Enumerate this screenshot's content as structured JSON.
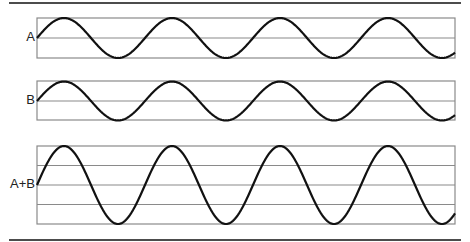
{
  "figure": {
    "panels": [
      {
        "id": "A",
        "label": "A",
        "top": 18,
        "bottom": 58,
        "hlines": [
          38
        ],
        "amplitude": 20,
        "center": 38
      },
      {
        "id": "B",
        "label": "B",
        "top": 81,
        "bottom": 120,
        "hlines": [
          101
        ],
        "amplitude": 19.5,
        "center": 101
      },
      {
        "id": "AB",
        "label": "A+B",
        "top": 146,
        "bottom": 224,
        "hlines": [
          165.5,
          185,
          204.5
        ],
        "amplitude": 39,
        "center": 185
      }
    ],
    "box_left": 37,
    "box_right": 455,
    "wave_period": 108,
    "rules": {
      "top_y": 3,
      "bottom_y": 240,
      "left": 9,
      "right": 461
    },
    "colors": {
      "wave": "#111111",
      "box": "#8a8a8a",
      "rule": "#111111"
    }
  },
  "chart_data": {
    "type": "line",
    "title": "",
    "series": [
      {
        "name": "A",
        "amplitude": 1,
        "phase": 0,
        "cycles": 3.9
      },
      {
        "name": "B",
        "amplitude": 1,
        "phase": 0,
        "cycles": 3.9
      },
      {
        "name": "A+B",
        "amplitude": 2,
        "phase": 0,
        "cycles": 3.9
      }
    ],
    "xlabel": "",
    "ylabel": "",
    "grid": true
  }
}
